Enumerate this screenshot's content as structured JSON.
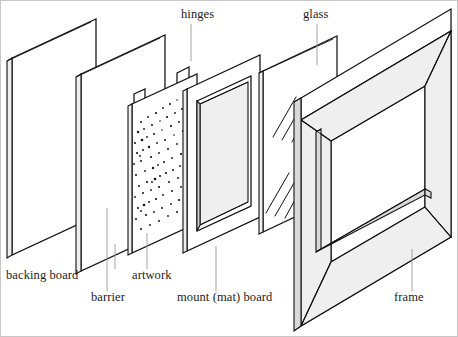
{
  "diagram": {
    "style": {
      "background": "#ffffff",
      "ink": "#111111",
      "leader": "#9a9a9a",
      "edge_fill": "#efefef",
      "text": "#1c1c1c"
    },
    "labels": [
      {
        "id": "backing-board",
        "text": "backing board",
        "x": 5,
        "y": 278,
        "anchor": "start",
        "leader": {
          "x": 114,
          "y1": 243,
          "x2": 114,
          "y2": 268
        }
      },
      {
        "id": "barrier",
        "text": "barrier",
        "x": 90,
        "y": 300,
        "anchor": "start",
        "leader": {
          "x": 106,
          "y1": 207,
          "x2": 106,
          "y2": 290
        }
      },
      {
        "id": "artwork",
        "text": "artwork",
        "x": 131,
        "y": 278,
        "anchor": "start",
        "leader": {
          "x": 146,
          "y1": 232,
          "x2": 146,
          "y2": 268
        }
      },
      {
        "id": "mount-mat-board",
        "text": "mount (mat) board",
        "x": 176,
        "y": 300,
        "anchor": "start",
        "leader": {
          "x": 215,
          "y1": 245,
          "x2": 215,
          "y2": 290
        }
      },
      {
        "id": "frame",
        "text": "frame",
        "x": 393,
        "y": 300,
        "anchor": "start",
        "leader": {
          "x": 411,
          "y1": 248,
          "x2": 411,
          "y2": 290
        }
      },
      {
        "id": "hinges",
        "text": "hinges",
        "x": 180,
        "y": 17,
        "anchor": "start",
        "leader": {
          "x": 190,
          "y1": 23,
          "x2": 190,
          "y2": 60
        }
      },
      {
        "id": "glass",
        "text": "glass",
        "x": 302,
        "y": 17,
        "anchor": "start",
        "leader": {
          "x": 316,
          "y1": 23,
          "x2": 316,
          "y2": 64
        }
      }
    ],
    "components": [
      {
        "id": "backing-board",
        "label": "backing board",
        "order": 1,
        "kind": "flat-panel"
      },
      {
        "id": "barrier",
        "label": "barrier",
        "order": 2,
        "kind": "flat-panel"
      },
      {
        "id": "artwork",
        "label": "artwork",
        "order": 3,
        "kind": "stippled-panel-with-hinges"
      },
      {
        "id": "hinges",
        "label": "hinges",
        "order": 4,
        "kind": "tabs"
      },
      {
        "id": "mount-mat-board",
        "label": "mount (mat) board",
        "order": 5,
        "kind": "window-panel"
      },
      {
        "id": "glass",
        "label": "glass",
        "order": 6,
        "kind": "transparent-panel"
      },
      {
        "id": "frame",
        "label": "frame",
        "order": 7,
        "kind": "molding-box"
      }
    ]
  }
}
